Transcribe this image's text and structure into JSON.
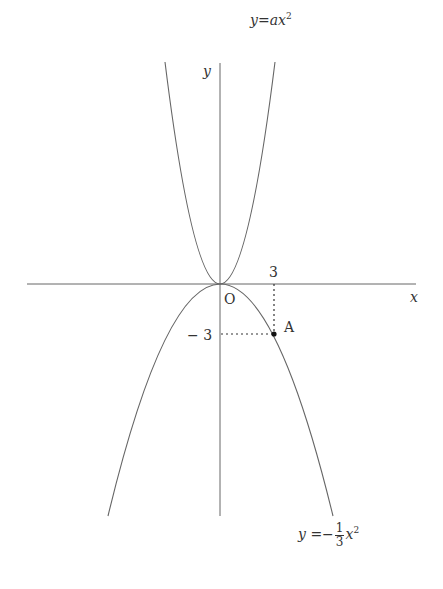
{
  "diagram": {
    "axes": {
      "x_label": "x",
      "y_label": "y",
      "origin_label": "O"
    },
    "curves": [
      {
        "name": "upper-parabola",
        "equation_lhs": "y",
        "equation_eq": "=",
        "equation_coef": "a",
        "equation_var": "x",
        "equation_exp": "2"
      },
      {
        "name": "lower-parabola",
        "equation_lhs": "y",
        "equation_eq": "=",
        "equation_sign": "−",
        "frac_num": "1",
        "frac_den": "3",
        "equation_var": "x",
        "equation_exp": "2"
      }
    ],
    "point": {
      "label": "A",
      "x": 3,
      "y": -3
    },
    "tick_labels": {
      "x": "3",
      "y": "− 3"
    },
    "colors": {
      "line": "#555555",
      "text": "#333333"
    }
  }
}
